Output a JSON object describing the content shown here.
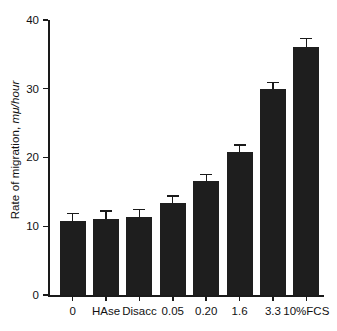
{
  "chart_data": {
    "type": "bar",
    "title": "",
    "xlabel": "",
    "ylabel": "Rate of migration, mμ/hour",
    "ylabel_prefix": "Rate of migration, ",
    "ylabel_italic": "mμ/hour",
    "categories": [
      "0",
      "HAse",
      "Disacc",
      "0.05",
      "0.20",
      "1.6",
      "3.3",
      "10%FCS"
    ],
    "values": [
      10.8,
      11.0,
      11.4,
      13.4,
      16.6,
      20.8,
      30.0,
      36.1
    ],
    "errors": [
      1.2,
      1.3,
      1.1,
      1.1,
      1.0,
      1.1,
      1.0,
      1.3
    ],
    "ylim": [
      0,
      40
    ],
    "yticks": [
      0,
      10,
      20,
      30,
      40
    ],
    "ytick_labels": [
      "0",
      "10",
      "20",
      "30",
      "40"
    ],
    "grid": false,
    "legend": false,
    "bar_color": "#1e1e1e",
    "axis_color": "#1a1a1a",
    "background_color": "#ffffff"
  }
}
